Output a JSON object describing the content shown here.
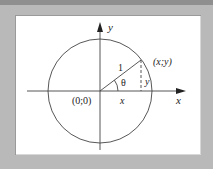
{
  "diagram": {
    "axes": {
      "x_label": "x",
      "y_label": "y"
    },
    "origin_label": "(0;0)",
    "point_label": "(x;y)",
    "radius_label": "1",
    "angle_label": "θ",
    "x_projection_label": "x",
    "y_projection_label": "y"
  },
  "colors": {
    "background": "#b9b9b9",
    "panel": "#ffffff",
    "stroke": "#333333"
  }
}
